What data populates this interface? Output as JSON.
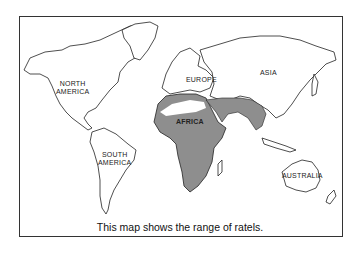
{
  "map": {
    "title": "World map – range of ratels",
    "colors": {
      "land_outline": "#222222",
      "range_fill": "#8e8e8e",
      "background": "#ffffff"
    },
    "labels": {
      "north_america": "NORTH\nAMERICA",
      "north_america_l1": "NORTH",
      "north_america_l2": "AMERICA",
      "south_america_l1": "SOUTH",
      "south_america_l2": "AMERICA",
      "europe": "EUROPE",
      "asia": "ASIA",
      "africa": "AFRICA",
      "australia": "AUSTRALIA"
    },
    "caption": "This map shows the range of ratels."
  }
}
